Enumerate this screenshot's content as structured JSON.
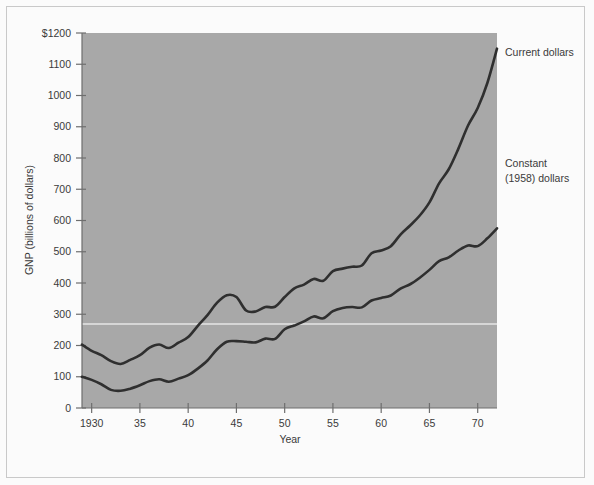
{
  "figure": {
    "background_color": "#fbfbfb",
    "plot_background_color": "#a8a8a8",
    "line_color": "#2f2f2f",
    "text_color": "#3a3a3a",
    "frame_color": "#c9c9c9"
  },
  "chart_data": {
    "type": "line",
    "title": "",
    "xlabel": "Year",
    "ylabel": "GNP (billions of dollars)",
    "xlim": [
      1929,
      1972
    ],
    "ylim": [
      0,
      1200
    ],
    "grid": false,
    "legend_position": "right-inline",
    "x_tick_labels": [
      "1930",
      "35",
      "40",
      "45",
      "50",
      "55",
      "60",
      "65",
      "70"
    ],
    "x_ticks": [
      1930,
      1935,
      1940,
      1945,
      1950,
      1955,
      1960,
      1965,
      1970
    ],
    "y_tick_labels": [
      "0",
      "100",
      "200",
      "300",
      "400",
      "500",
      "600",
      "700",
      "800",
      "900",
      "1000",
      "1100",
      "$1200"
    ],
    "y_ticks": [
      0,
      100,
      200,
      300,
      400,
      500,
      600,
      700,
      800,
      900,
      1000,
      1100,
      1200
    ],
    "x": [
      1929,
      1930,
      1931,
      1932,
      1933,
      1934,
      1935,
      1936,
      1937,
      1938,
      1939,
      1940,
      1941,
      1942,
      1943,
      1944,
      1945,
      1946,
      1947,
      1948,
      1949,
      1950,
      1951,
      1952,
      1953,
      1954,
      1955,
      1956,
      1957,
      1958,
      1959,
      1960,
      1961,
      1962,
      1963,
      1964,
      1965,
      1966,
      1967,
      1968,
      1969,
      1970,
      1971,
      1972
    ],
    "series": [
      {
        "name": "Current dollars",
        "label": "Current dollars",
        "values": [
          203,
          183,
          169,
          150,
          141,
          154,
          169,
          193,
          203,
          192,
          209,
          227,
          263,
          297,
          337,
          361,
          355,
          312,
          309,
          323,
          324,
          355,
          383,
          395,
          413,
          407,
          438,
          446,
          452,
          456,
          495,
          504,
          518,
          555,
          584,
          616,
          658,
          719,
          764,
          830,
          904,
          960,
          1040,
          1150
        ]
      },
      {
        "name": "Constant (1958) dollars",
        "label": "Constant (1958) dollars",
        "values": [
          100,
          90,
          76,
          58,
          55,
          62,
          73,
          86,
          92,
          84,
          94,
          105,
          126,
          152,
          188,
          212,
          214,
          212,
          210,
          222,
          221,
          252,
          264,
          277,
          293,
          287,
          310,
          320,
          323,
          322,
          344,
          352,
          360,
          382,
          396,
          417,
          442,
          470,
          482,
          504,
          520,
          518,
          543,
          575
        ]
      }
    ],
    "annotations": []
  },
  "plot_geometry": {
    "left": 82,
    "top": 33,
    "right": 497,
    "bottom": 408
  },
  "artifact": {
    "scan_line_y": 324,
    "scan_line_color": "#f2f2f2"
  }
}
